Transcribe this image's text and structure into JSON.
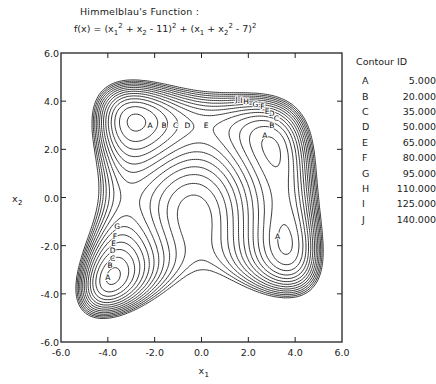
{
  "chart_data": {
    "type": "contour",
    "title": "Himmelblau's Function :",
    "formula": "f(x) = (x1^2 + x2 - 11)^2 + (x1 + x2^2 - 7)^2",
    "xlabel": "x1",
    "ylabel": "x2",
    "xlim": [
      -6.0,
      6.0
    ],
    "ylim": [
      -6.0,
      6.0
    ],
    "x_ticks": [
      "-6.0",
      "-4.0",
      "-2.0",
      "0.0",
      "2.0",
      "4.0",
      "6.0"
    ],
    "y_ticks": [
      "6.0",
      "4.0",
      "2.0",
      "0.0",
      "-2.0",
      "-4.0",
      "-6.0"
    ],
    "grid": false,
    "legend_title": "Contour ID",
    "legend": [
      {
        "id": "A",
        "value": "5.000"
      },
      {
        "id": "B",
        "value": "20.000"
      },
      {
        "id": "C",
        "value": "35.000"
      },
      {
        "id": "D",
        "value": "50.000"
      },
      {
        "id": "E",
        "value": "65.000"
      },
      {
        "id": "F",
        "value": "80.000"
      },
      {
        "id": "G",
        "value": "95.000"
      },
      {
        "id": "H",
        "value": "110.000"
      },
      {
        "id": "I",
        "value": "125.000"
      },
      {
        "id": "J",
        "value": "140.000"
      }
    ],
    "levels": [
      5,
      20,
      35,
      50,
      65,
      80,
      95,
      110,
      125,
      140,
      155,
      170,
      185,
      200
    ],
    "minima": [
      [
        3.0,
        2.0
      ],
      [
        -2.805,
        3.131
      ],
      [
        -3.779,
        -3.283
      ],
      [
        3.584,
        -1.848
      ]
    ]
  },
  "labels": {
    "title": "Himmelblau's Function :",
    "fx": "f(x) = (x",
    "p1": " + x",
    "p2": " - 11)",
    "p3": " + (x",
    "p4": " + x",
    "p5": " - 7)",
    "sub1": "1",
    "sub2": "2",
    "sup2": "2",
    "legend_title": "Contour ID",
    "xlabel": "x",
    "xlabel_sub": "1",
    "ylabel": "x",
    "ylabel_sub": "2"
  },
  "colors": {
    "line": "#222222",
    "background": "#ffffff"
  }
}
